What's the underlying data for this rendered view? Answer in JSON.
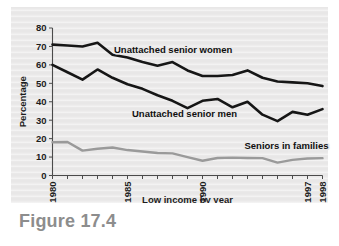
{
  "figure": {
    "caption": "Figure 17.4"
  },
  "chart_data": {
    "type": "line",
    "title": "",
    "xlabel": "Low income by year",
    "ylabel": "Percentage",
    "ylim": [
      0,
      80
    ],
    "ytick_step": 10,
    "yticks": [
      "0",
      "10",
      "20",
      "30",
      "40",
      "50",
      "60",
      "70",
      "80"
    ],
    "xlim": [
      1980,
      1998
    ],
    "x": [
      1980,
      1981,
      1982,
      1983,
      1984,
      1985,
      1986,
      1987,
      1988,
      1989,
      1990,
      1991,
      1992,
      1993,
      1994,
      1995,
      1996,
      1997,
      1998
    ],
    "xticks_labeled": [
      "1980",
      "1985",
      "1990",
      "1997",
      "1998"
    ],
    "xtick_values_labeled": [
      1980,
      1985,
      1990,
      1997,
      1998
    ],
    "grid": false,
    "legend_position": "inline-annotations",
    "series": [
      {
        "name": "Unattached senior women",
        "color": "#161616",
        "label_x": 1984.1,
        "label_y": 66.5,
        "values": [
          71,
          70.5,
          70,
          72,
          65.5,
          64,
          61.5,
          59.5,
          61.5,
          57,
          54,
          54,
          54.5,
          57,
          53,
          51,
          50.5,
          50,
          48.5
        ]
      },
      {
        "name": "Unattached senior men",
        "color": "#161616",
        "label_x": 1985.3,
        "label_y": 31.5,
        "values": [
          60,
          56,
          52,
          57.5,
          53,
          49.5,
          47,
          43.5,
          40.5,
          36.5,
          40.5,
          41.5,
          37,
          40,
          33,
          29.5,
          34.5,
          33,
          36
        ]
      },
      {
        "name": "Seniors in families",
        "color": "#9a9a9a",
        "label_x": 1992.8,
        "label_y": 14.5,
        "values": [
          18,
          18.2,
          13.5,
          14.5,
          15.2,
          13.8,
          13,
          12.2,
          12,
          10,
          8,
          9.5,
          9.7,
          9.5,
          9.4,
          7,
          8.5,
          9.2,
          9.4
        ]
      }
    ]
  }
}
